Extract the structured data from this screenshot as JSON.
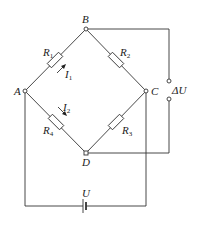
{
  "diagram": {
    "type": "wheatstone-bridge",
    "nodes": {
      "A": {
        "label": "A"
      },
      "B": {
        "label": "B"
      },
      "C": {
        "label": "C"
      },
      "D": {
        "label": "D"
      }
    },
    "resistors": [
      {
        "name": "R",
        "sub": "1",
        "between": "A-B"
      },
      {
        "name": "R",
        "sub": "2",
        "between": "B-C"
      },
      {
        "name": "R",
        "sub": "3",
        "between": "C-D"
      },
      {
        "name": "R",
        "sub": "4",
        "between": "A-D"
      }
    ],
    "currents": [
      {
        "name": "I",
        "sub": "1",
        "branch": "A-B"
      },
      {
        "name": "I",
        "sub": "2",
        "branch": "A-D"
      }
    ],
    "output_label": "ΔU",
    "source_label": "U"
  }
}
